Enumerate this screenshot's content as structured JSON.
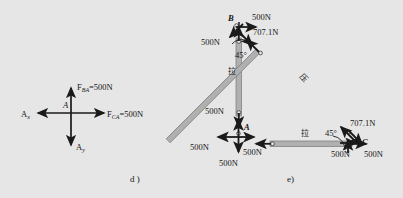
{
  "figure": {
    "background_color": "#e6e6e6",
    "ink_color": "#1a1a1a",
    "member_fill": "#b0b0b0",
    "member_stroke": "#6e6e6e",
    "captions": {
      "left": "d )",
      "right": "e)"
    }
  },
  "panel_d": {
    "name": "joint-A-free-body",
    "joint_label": "A",
    "forces": [
      {
        "id": "f-ba",
        "label_main": "F",
        "label_sub": "BA",
        "label_value": "=500N",
        "direction": "up"
      },
      {
        "id": "f-ca",
        "label_main": "F",
        "label_sub": "CA",
        "label_value": "=500N",
        "direction": "right"
      },
      {
        "id": "a-x",
        "label_main": "A",
        "label_sub": "x",
        "label_value": "",
        "direction": "left"
      },
      {
        "id": "a-y",
        "label_main": "A",
        "label_sub": "y",
        "label_value": "",
        "direction": "down"
      }
    ]
  },
  "panel_e": {
    "name": "truss-members-free-body",
    "joints": [
      {
        "id": "joint-b",
        "label": "B"
      },
      {
        "id": "joint-a",
        "label": "A"
      },
      {
        "id": "joint-c",
        "label": "C"
      }
    ],
    "members": [
      {
        "id": "member-ab",
        "label": "拉",
        "meaning": "tension",
        "orientation": "vertical"
      },
      {
        "id": "member-ac",
        "label": "拉",
        "meaning": "tension",
        "orientation": "horizontal"
      },
      {
        "id": "member-bc",
        "label": "压",
        "meaning": "compression",
        "orientation": "diagonal"
      }
    ],
    "angles": [
      {
        "id": "angle-at-b",
        "label": "45°"
      },
      {
        "id": "angle-at-c",
        "label": "45°"
      }
    ],
    "force_labels": [
      {
        "id": "b-500-right",
        "text": "500N"
      },
      {
        "id": "b-500-left",
        "text": "500N"
      },
      {
        "id": "b-707",
        "text": "707.1N"
      },
      {
        "id": "ab-lower-500",
        "text": "500N"
      },
      {
        "id": "a-500-left",
        "text": "500N"
      },
      {
        "id": "a-500-right",
        "text": "500N"
      },
      {
        "id": "a-500-down",
        "text": "500N"
      },
      {
        "id": "c-707",
        "text": "707.1N"
      },
      {
        "id": "c-500-left",
        "text": "500N"
      },
      {
        "id": "c-500-right",
        "text": "500N"
      }
    ]
  }
}
